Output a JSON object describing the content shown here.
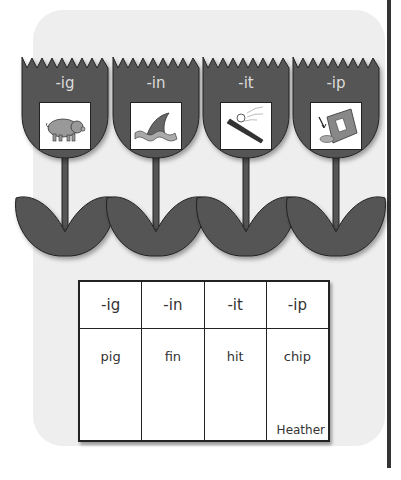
{
  "tulips": [
    {
      "label": "-ig",
      "picture": "pig"
    },
    {
      "label": "-in",
      "picture": "shark fin"
    },
    {
      "label": "-it",
      "picture": "bat hitting ball"
    },
    {
      "label": "-ip",
      "picture": "bag of chips"
    }
  ],
  "table": {
    "headers": [
      "-ig",
      "-in",
      "-it",
      "-ip"
    ],
    "words": [
      "pig",
      "fin",
      "hit",
      "chip"
    ],
    "signature": "Heather"
  },
  "colors": {
    "panel": "#eeeeee",
    "tulip": "#555555",
    "outline": "#222222",
    "rule": "#333333"
  }
}
